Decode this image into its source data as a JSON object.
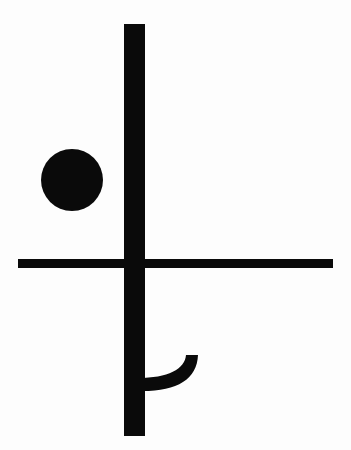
{
  "image": {
    "title": "Abstract black glyph on white background",
    "description": "A high-contrast monochrome symbolic figure composed of a long vertical stroke crossed by a long horizontal stroke, a solid filled disc at upper left, and a crescent hook arc attached at the lower right of the vertical stroke.",
    "width": 351,
    "height": 450,
    "background_color": "#fdfdfd",
    "ink_color": "#0a0a0a"
  },
  "shapes": {
    "vertical_stroke": {
      "name": "vertical-stroke",
      "type": "rectangle",
      "x": 124,
      "y": 24,
      "width": 21,
      "height": 412
    },
    "horizontal_stroke": {
      "name": "horizontal-stroke",
      "type": "rectangle",
      "x": 18,
      "y": 259,
      "width": 315,
      "height": 9
    },
    "disc": {
      "name": "filled-disc",
      "type": "circle",
      "cx": 72,
      "cy": 180,
      "r": 31
    },
    "hook_arc": {
      "name": "crescent-hook",
      "type": "crescent",
      "tip_x": 198,
      "tip_y": 355,
      "base_x": 138,
      "base_y": 390,
      "path": "M 198 355 C 197 380 176 392 138 391 L 138 378 C 168 378 185 369 186 355 Z"
    }
  }
}
